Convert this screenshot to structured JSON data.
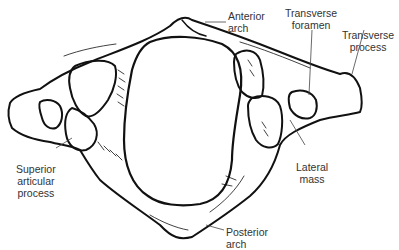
{
  "diagram": {
    "labels": {
      "anterior_arch": "Anterior\narch",
      "transverse_foramen": "Transverse\nforamen",
      "transverse_process": "Transverse\nprocess",
      "superior_articular_process": "Superior\narticular\nprocess",
      "lateral_mass": "Lateral\nmass",
      "posterior_arch": "Posterior\narch"
    },
    "colors": {
      "line": "#111111",
      "label_text": "#333333",
      "background": "#ffffff"
    }
  }
}
